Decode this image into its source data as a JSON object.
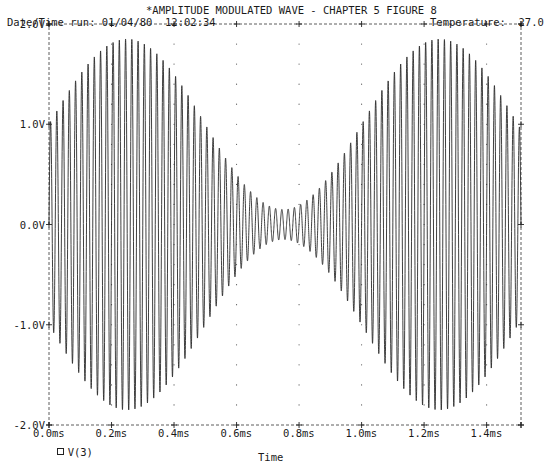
{
  "header": {
    "title": "*AMPLITUDE MODULATED WAVE - CHAPTER 5 FIGURE 8",
    "date_time_label": "Date/Time run: 01/04/80  12:02:34",
    "temperature_label": "Temperature:  27.0"
  },
  "legend": {
    "marker": "square",
    "label": "V(3)"
  },
  "chart_data": {
    "type": "line",
    "title": "*AMPLITUDE MODULATED WAVE - CHAPTER 5 FIGURE 8",
    "xlabel": "Time",
    "ylabel": "",
    "x_unit": "ms",
    "xlim": [
      0.0,
      1.51
    ],
    "ylim": [
      -2.0,
      2.0
    ],
    "x_ticks": [
      "0.0ms",
      "0.2ms",
      "0.4ms",
      "0.6ms",
      "0.8ms",
      "1.0ms",
      "1.2ms",
      "1.4ms"
    ],
    "x_tick_values": [
      0.0,
      0.2,
      0.4,
      0.6,
      0.8,
      1.0,
      1.2,
      1.4
    ],
    "y_ticks": [
      "2.0V",
      "1.0V",
      "0.0V",
      "-1.0V",
      "-2.0V"
    ],
    "y_tick_values": [
      2.0,
      1.0,
      0.0,
      -1.0,
      -2.0
    ],
    "grid": "dotted",
    "legend_position": "bottom-left",
    "series": [
      {
        "name": "V(3)",
        "description": "Amplitude-modulated sine: carrier ~50 kHz, modulation 1 kHz",
        "carrier_freq_khz": 50,
        "modulation_freq_khz": 1,
        "carrier_amplitude_v": 1.0,
        "modulation_index": 0.85,
        "envelope_peak_v": 1.85,
        "envelope_min_v": 0.15,
        "envelope_peaks_ms": [
          0.25,
          1.25
        ],
        "envelope_minimum_ms": [
          0.75
        ],
        "envelope_samples": {
          "t_ms": [
            0.0,
            0.1,
            0.2,
            0.25,
            0.3,
            0.4,
            0.5,
            0.6,
            0.7,
            0.75,
            0.8,
            0.9,
            1.0,
            1.1,
            1.2,
            1.25,
            1.3,
            1.4,
            1.5
          ],
          "amplitude_v": [
            1.0,
            1.5,
            1.81,
            1.85,
            1.81,
            1.5,
            1.0,
            0.5,
            0.19,
            0.15,
            0.19,
            0.5,
            1.0,
            1.5,
            1.81,
            1.85,
            1.81,
            1.5,
            1.0
          ]
        }
      }
    ]
  }
}
